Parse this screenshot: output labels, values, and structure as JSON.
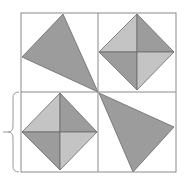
{
  "figure": {
    "colors": {
      "background": "#ffffff",
      "grid_line": "#8a8a8a",
      "shape_edge": "#6a6a6a",
      "dark_fill": "#9c9c9c",
      "light_fill": "#c4c4c4",
      "brace": "#9a9a9a"
    },
    "grid": {
      "left": 21,
      "top": 13,
      "right": 176,
      "bottom": 172,
      "mid_x": 98,
      "mid_y": 92
    },
    "cells": [
      {
        "position": "top-left",
        "shape": "triangle",
        "points": [
          [
            63,
            14
          ],
          [
            22,
            57
          ],
          [
            98,
            92
          ]
        ]
      },
      {
        "position": "top-right",
        "shape": "quartered-diamond",
        "center": [
          137,
          52
        ],
        "top": [
          137,
          14
        ],
        "left": [
          99,
          52
        ],
        "right": [
          174,
          52
        ],
        "bottom": [
          137,
          90
        ]
      },
      {
        "position": "bottom-left",
        "shape": "quartered-diamond",
        "center": [
          60,
          132
        ],
        "top": [
          60,
          93
        ],
        "left": [
          22,
          132
        ],
        "right": [
          97,
          132
        ],
        "bottom": [
          60,
          170
        ]
      },
      {
        "position": "bottom-right",
        "shape": "triangle",
        "points": [
          [
            99,
            93
          ],
          [
            174,
            127
          ],
          [
            133,
            172
          ]
        ]
      }
    ],
    "brace": {
      "side": "left",
      "x": 14,
      "top": 92,
      "bottom": 172,
      "tip": [
        4,
        132
      ]
    }
  }
}
